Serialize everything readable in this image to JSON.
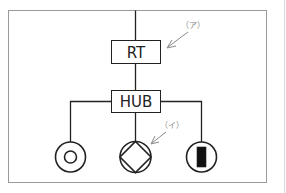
{
  "diagram": {
    "type": "network-topology",
    "nodes": {
      "router": {
        "label": "RT"
      },
      "hub": {
        "label": "HUB"
      },
      "devices": [
        {
          "id": "left",
          "symbol": "circle-with-ring"
        },
        {
          "id": "center",
          "symbol": "circle-with-diamond"
        },
        {
          "id": "right",
          "symbol": "circle-with-filled-bar"
        }
      ]
    },
    "edges": [
      {
        "from": "external",
        "to": "router"
      },
      {
        "from": "router",
        "to": "hub"
      },
      {
        "from": "hub",
        "to": "left"
      },
      {
        "from": "hub",
        "to": "center"
      },
      {
        "from": "hub",
        "to": "right"
      }
    ],
    "annotations": [
      {
        "label": "（ア）",
        "points_to": "router"
      },
      {
        "label": "（イ）",
        "points_to": "center"
      }
    ],
    "colors": {
      "line": "#222222",
      "frame": "#9a9a9a",
      "annotation": "#8a8a8a",
      "fill_dark": "#111111"
    }
  }
}
